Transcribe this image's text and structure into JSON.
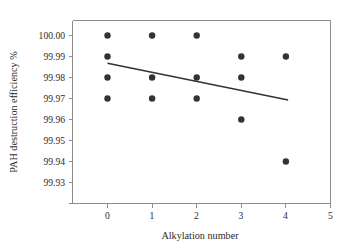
{
  "chart_data": {
    "type": "scatter",
    "title": "",
    "xlabel": "Alkylation number",
    "ylabel": "PAH destruction efficiency %",
    "xlim": [
      -0.4,
      5.0
    ],
    "ylim": [
      99.93,
      100.005
    ],
    "grid": false,
    "legend": "none",
    "xticks": [
      0,
      1,
      2,
      3,
      4,
      5
    ],
    "xtick_labels": [
      "0",
      "1",
      "2",
      "3",
      "4",
      "5"
    ],
    "yticks": [
      99.93,
      99.94,
      99.95,
      99.96,
      99.97,
      99.98,
      99.99,
      100.0
    ],
    "ytick_labels": [
      "99.93",
      "99.94",
      "99.95",
      "99.96",
      "99.97",
      "99.98",
      "99.99",
      "100.00"
    ],
    "series": [
      {
        "name": "PAH destruction efficiency",
        "marker": "circle",
        "color": "#333333",
        "points": [
          {
            "x": 0,
            "y": 100.0
          },
          {
            "x": 0,
            "y": 99.99
          },
          {
            "x": 0,
            "y": 99.98
          },
          {
            "x": 0,
            "y": 99.97
          },
          {
            "x": 1,
            "y": 100.0
          },
          {
            "x": 1,
            "y": 99.98
          },
          {
            "x": 1,
            "y": 99.97
          },
          {
            "x": 2,
            "y": 100.0
          },
          {
            "x": 2,
            "y": 99.98
          },
          {
            "x": 2,
            "y": 99.97
          },
          {
            "x": 3,
            "y": 99.99
          },
          {
            "x": 3,
            "y": 99.98
          },
          {
            "x": 3,
            "y": 99.96
          },
          {
            "x": 4,
            "y": 99.99
          },
          {
            "x": 4,
            "y": 99.94
          }
        ]
      }
    ],
    "trend_line": {
      "name": "linear fit",
      "color": "#333333",
      "x_start": 0.0,
      "y_start": 99.9868,
      "x_end": 4.05,
      "y_end": 99.9693
    }
  },
  "colors": {
    "marker": "#333333",
    "trend": "#333333",
    "axis": "#8d8d8d",
    "text": "#2b2b2b",
    "background": "#ffffff"
  }
}
